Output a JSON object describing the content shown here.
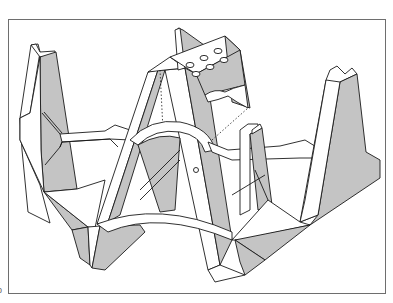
{
  "figure": {
    "type": "isometric technical line drawing",
    "colors": {
      "background": "#ffffff",
      "line": "#1a1a1a",
      "shade": "#c4c4c4",
      "frame": "#6e6e6e"
    },
    "cap_holes": 6,
    "corner_label": "b"
  }
}
